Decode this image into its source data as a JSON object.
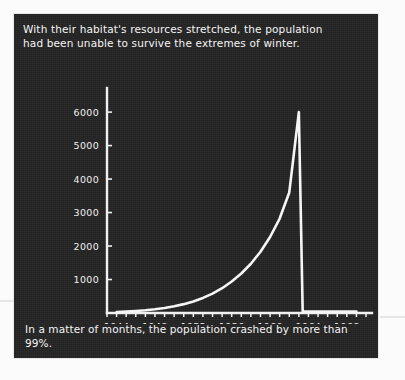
{
  "panel": {
    "background_color": "#232323",
    "text_color": "#f2f2f2"
  },
  "top_caption": "With their habitat's resources stretched, the population\nhad been unable to survive the extremes of winter.",
  "bottom_caption": "In a matter of months, the population crashed by more than 99%.",
  "chart_data": {
    "type": "line",
    "title": "",
    "xlabel": "",
    "ylabel": "",
    "xlim": [
      1943,
      1970
    ],
    "ylim": [
      0,
      6600
    ],
    "grid": false,
    "legend": "none",
    "line_color": "#f5f5f5",
    "axis_color": "#f0f0f0",
    "ytick_labels": [
      "6000",
      "5000",
      "4000",
      "3000",
      "2000",
      "1000"
    ],
    "ytick_values": [
      6000,
      5000,
      4000,
      3000,
      2000,
      1000
    ],
    "xtick_labels": [
      "1944",
      "1948",
      "1952",
      "1956",
      "1960",
      "1964",
      "1968"
    ],
    "xtick_values": [
      1944,
      1948,
      1952,
      1956,
      1960,
      1964,
      1968
    ],
    "xtick_minor_step": 1,
    "series": [
      {
        "name": "Reindeer population",
        "x": [
          1944,
          1945,
          1946,
          1947,
          1948,
          1949,
          1950,
          1951,
          1952,
          1953,
          1954,
          1955,
          1956,
          1957,
          1958,
          1959,
          1960,
          1961,
          1962,
          1963,
          1963.4,
          1964,
          1965,
          1966,
          1967,
          1968,
          1969
        ],
        "y": [
          25,
          40,
          58,
          80,
          110,
          150,
          200,
          265,
          345,
          450,
          580,
          740,
          940,
          1180,
          1470,
          1830,
          2270,
          2820,
          3600,
          6000,
          42,
          42,
          42,
          42,
          42,
          42,
          42
        ]
      }
    ],
    "annotations": [
      {
        "text": "peak population",
        "x": 1963,
        "y": 6000
      },
      {
        "text": "crash",
        "x": 1963.4,
        "y": 42
      }
    ]
  }
}
